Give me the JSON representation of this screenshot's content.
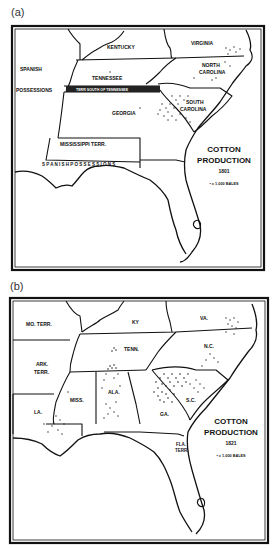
{
  "figure": {
    "panels": [
      {
        "label": "(a)",
        "title_line1": "COTTON",
        "title_line2": "PRODUCTION",
        "year": "1801",
        "legend": "• = 1,000 BALES",
        "regions": {
          "spanish": "SPANISH",
          "possessions": "POSSESSIONS",
          "kentucky": "KENTUCKY",
          "virginia": "VIRGINIA",
          "tennessee": "TENNESSEE",
          "north_carolina_1": "NORTH",
          "north_carolina_2": "CAROLINA",
          "terr_south": "TERR SOUTH OF TENNESSEE",
          "georgia": "GEORGIA",
          "south_carolina_1": "SOUTH",
          "south_carolina_2": "CAROLINA",
          "mississippi_terr": "MISSISSIPPI TERR.",
          "spanish_possessions_coast": "S P A N I S H   P O S S E S S I O N S"
        }
      },
      {
        "label": "(b)",
        "title_line1": "COTTON",
        "title_line2": "PRODUCTION",
        "year": "1821",
        "legend": "• = 1,000 BALES",
        "regions": {
          "mo_terr": "MO. TERR.",
          "ky": "KY",
          "va": "VA.",
          "tenn": "TENN.",
          "nc": "N.C.",
          "ark_terr_1": "ARK.",
          "ark_terr_2": "TERR.",
          "miss": "MISS.",
          "ala": "ALA.",
          "sc": "S.C.",
          "la": "LA.",
          "ga": "GA.",
          "fla_terr_1": "FLA.",
          "fla_terr_2": "TERR."
        }
      }
    ]
  }
}
